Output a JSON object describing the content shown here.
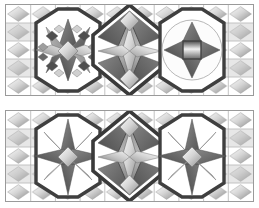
{
  "document": {
    "title": "Stained Glass Panel Designs",
    "background_color": "#ffffff",
    "width": 259,
    "height": 208
  },
  "palette": {
    "lead_dark": "#3a3a3a",
    "lead_mid": "#5e5e5e",
    "glass_white": "#ffffff",
    "glass_light": "#e2e2e2",
    "glass_mid_light": "#c9c9c9",
    "glass_mid": "#a8a8a8",
    "glass_mid_dark": "#8a8a8a",
    "glass_dark": "#6b6b6b",
    "glass_darker": "#4f4f4f",
    "grid_line": "#9a9a9a",
    "border": "#9a9a9a"
  },
  "panels": [
    {
      "id": "panel-top",
      "name": "upper-panel",
      "label": "Upper stained glass panel",
      "grid": {
        "columns": 10,
        "rows": 5,
        "cell": 24.7,
        "show_lines": true
      },
      "motifs": [
        {
          "name": "left-block",
          "type": "eight-point-star-with-checkerboard",
          "center_x": 62,
          "center_y": 46,
          "description": "Eight point star with checkerboard diamond arms inside an octagonal lead frame"
        },
        {
          "name": "center-block",
          "type": "tall-diamond-lozenge",
          "center_x": 124,
          "center_y": 46,
          "description": "Large vertical lozenge with internal four-point star and faceted kite panes"
        },
        {
          "name": "right-block",
          "type": "four-point-star-in-octagon",
          "center_x": 186,
          "center_y": 46,
          "description": "Four point star in circle/octagon with small central square pane"
        }
      ]
    },
    {
      "id": "panel-bottom",
      "name": "lower-panel",
      "label": "Lower stained glass panel",
      "grid": {
        "columns": 10,
        "rows": 5,
        "cell": 24.7,
        "show_lines": true
      },
      "motifs": [
        {
          "name": "left-block",
          "type": "eight-point-pinwheel-star",
          "center_x": 62,
          "center_y": 46,
          "description": "Eight point spiked star with alternating light and dark rays"
        },
        {
          "name": "center-block",
          "type": "tall-diamond-lozenge",
          "center_x": 124,
          "center_y": 46,
          "description": "Large vertical lozenge with internal four-point star and faceted kite panes"
        },
        {
          "name": "right-block",
          "type": "eight-point-pinwheel-star",
          "center_x": 186,
          "center_y": 46,
          "description": "Eight point spiked star with alternating light and dark rays"
        }
      ]
    }
  ]
}
